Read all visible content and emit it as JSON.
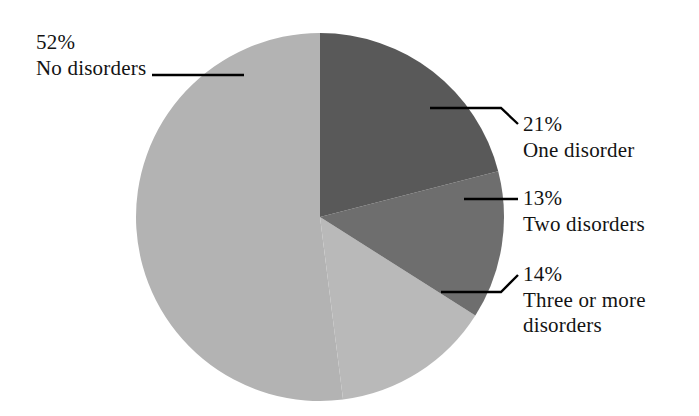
{
  "chart_data": {
    "type": "pie",
    "title": "",
    "subtitle": "",
    "xlabel": "",
    "ylabel": "",
    "legend_position": "none",
    "grid": false,
    "categories": [
      "One disorder",
      "Two disorders",
      "Three or more disorders",
      "No disorders"
    ],
    "values": [
      21,
      13,
      14,
      52
    ],
    "units": "percent",
    "start_angle_deg": 0,
    "direction": "clockwise",
    "slices": [
      {
        "label": "One disorder",
        "value": 21,
        "value_text": "21%",
        "color": "#595959",
        "start_angle_deg": 0,
        "end_angle_deg": 75.6
      },
      {
        "label": "Two disorders",
        "value": 13,
        "value_text": "13%",
        "color": "#6e6e6e",
        "start_angle_deg": 75.6,
        "end_angle_deg": 122.4
      },
      {
        "label": "Three or more disorders",
        "value": 14,
        "value_text": "14%",
        "color": "#b9b9b9",
        "start_angle_deg": 122.4,
        "end_angle_deg": 172.8
      },
      {
        "label": "No disorders",
        "value": 52,
        "value_text": "52%",
        "color": "#b3b3b3",
        "start_angle_deg": 172.8,
        "end_angle_deg": 360
      }
    ]
  },
  "labels": {
    "no_disorders": {
      "percent": "52%",
      "name": "No disorders"
    },
    "one_disorder": {
      "percent": "21%",
      "name": "One disorder"
    },
    "two_disorders": {
      "percent": "13%",
      "name": "Two disorders"
    },
    "three_or_more": {
      "percent": "14%",
      "name": "Three or more disorders"
    }
  },
  "style": {
    "background": "#ffffff",
    "text_color": "#131313",
    "leader_line_color": "#000000"
  }
}
